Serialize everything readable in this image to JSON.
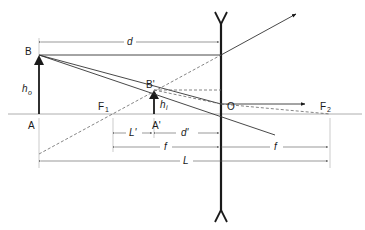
{
  "diagram": {
    "colors": {
      "ink": "#1a1a1a",
      "thin": "#555555",
      "axis": "#9a9a9a",
      "dash": "#666666"
    },
    "points": {
      "B": "B",
      "A": "A",
      "B_prime": "B'",
      "A_prime": "A'",
      "F1": "F",
      "F1_sub": "1",
      "F2": "F",
      "F2_sub": "2",
      "O": "O"
    },
    "heights": {
      "object": "h",
      "object_sub": "o",
      "image": "h",
      "image_sub": "i"
    },
    "dimensions": {
      "d": "d",
      "L_prime": "L'",
      "d_prime": "d'",
      "f_left": "f",
      "f_right": "f",
      "L": "L"
    }
  }
}
